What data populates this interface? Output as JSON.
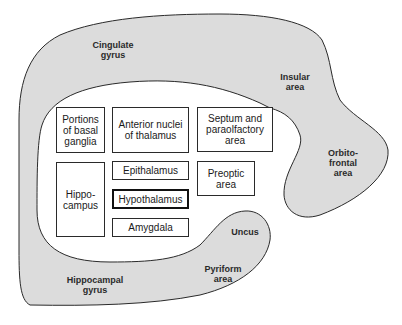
{
  "diagram": {
    "colors": {
      "fill": "#dcdcdc",
      "stroke": "#2a2a2a",
      "box_bg": "#ffffff"
    },
    "outer_regions": [
      {
        "id": "cingulate",
        "label": "Cingulate\ngyrus"
      },
      {
        "id": "insular",
        "label": "Insular\narea"
      },
      {
        "id": "orbitofrontal",
        "label": "Orbito-\nfrontal\narea"
      },
      {
        "id": "uncus",
        "label": "Uncus"
      },
      {
        "id": "pyriform",
        "label": "Pyriform\narea"
      },
      {
        "id": "hippocampal",
        "label": "Hippocampal\ngyrus"
      }
    ],
    "boxes": [
      {
        "id": "basal-ganglia",
        "label": "Portions\nof basal\nganglia"
      },
      {
        "id": "anterior-nuclei",
        "label": "Anterior nuclei\nof thalamus"
      },
      {
        "id": "septum",
        "label": "Septum and\nparaolfactory\narea"
      },
      {
        "id": "hippocampus",
        "label": "Hippo-\ncampus"
      },
      {
        "id": "epithalamus",
        "label": "Epithalamus"
      },
      {
        "id": "preoptic",
        "label": "Preoptic\narea"
      },
      {
        "id": "hypothalamus",
        "label": "Hypothalamus",
        "emphasized": true
      },
      {
        "id": "amygdala",
        "label": "Amygdala"
      }
    ]
  }
}
